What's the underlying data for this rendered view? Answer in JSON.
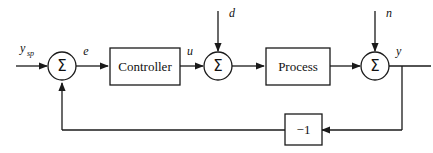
{
  "diagram": {
    "background_color": "#ffffff",
    "line_color": "#1a1a1a",
    "blocks": [
      {
        "id": "controller",
        "label": "Controller",
        "shape": "rectangle"
      },
      {
        "id": "process",
        "label": "Process",
        "shape": "rectangle"
      },
      {
        "id": "gain",
        "label": "−1",
        "shape": "rectangle"
      }
    ],
    "summers": [
      {
        "id": "summer-1",
        "glyph": "Σ"
      },
      {
        "id": "summer-2",
        "glyph": "Σ"
      },
      {
        "id": "summer-3",
        "glyph": "Σ"
      }
    ],
    "signals": [
      {
        "id": "setpoint",
        "label": "y",
        "subscript": "sp"
      },
      {
        "id": "error",
        "label": "e",
        "subscript": ""
      },
      {
        "id": "control-effort",
        "label": "u",
        "subscript": ""
      },
      {
        "id": "disturbance",
        "label": "d",
        "subscript": ""
      },
      {
        "id": "noise",
        "label": "n",
        "subscript": ""
      },
      {
        "id": "output",
        "label": "y",
        "subscript": ""
      }
    ]
  }
}
